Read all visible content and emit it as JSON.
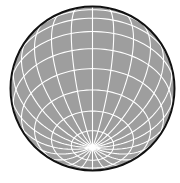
{
  "figure": {
    "type": "wireframe-globe",
    "width": 180,
    "height": 183,
    "center": [
      92.5,
      88.5
    ],
    "radius": 82,
    "tilt_degrees": 44,
    "meridian_step_degrees": 15,
    "parallel_step_degrees": 15,
    "colors": {
      "background": "#ffffff",
      "sphere_fill": "#9e9e9e",
      "grid_lines": "#ffffff",
      "outline": "#111111"
    },
    "line_width": 1.1,
    "outline_width": 2
  }
}
